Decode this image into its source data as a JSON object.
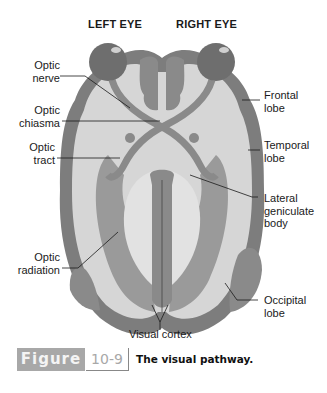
{
  "headers": {
    "left_eye": "LEFT EYE",
    "right_eye": "RIGHT EYE"
  },
  "labels": {
    "optic_nerve": [
      "Optic",
      "nerve"
    ],
    "optic_chiasma": [
      "Optic",
      "chiasma"
    ],
    "optic_tract": [
      "Optic",
      "tract"
    ],
    "optic_radiation": [
      "Optic",
      "radiation"
    ],
    "frontal_lobe": [
      "Frontal",
      "lobe"
    ],
    "temporal_lobe": [
      "Temporal",
      "lobe"
    ],
    "lateral_geniculate_body": [
      "Lateral",
      "geniculate",
      "body"
    ],
    "occipital_lobe": [
      "Occipital",
      "lobe"
    ],
    "visual_cortex": "Visual cortex"
  },
  "caption": {
    "figure_word": "Figure",
    "figure_number": "10-9",
    "title": "The visual pathway."
  },
  "colors": {
    "cortex": "#7d7d7d",
    "white_matter": "#d6d6d6",
    "eye": "#6e6e6e",
    "pathway": "#8a8a8a",
    "radiation": "#9a9a9a",
    "caption_box": "#a8a8a8"
  }
}
